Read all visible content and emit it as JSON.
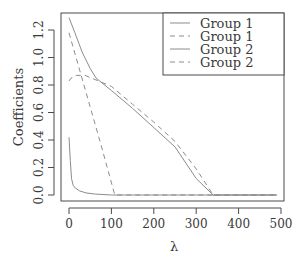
{
  "chart_data": {
    "type": "line",
    "title": "",
    "xlabel": "λ",
    "ylabel": "Coefficients",
    "xlim": [
      -12,
      512
    ],
    "ylim": [
      -0.04,
      1.32
    ],
    "grid": false,
    "legend_position": "top-right",
    "x_ticks": [
      0,
      100,
      200,
      300,
      400,
      500
    ],
    "x_tick_labels": [
      "0",
      "100",
      "200",
      "300",
      "400",
      "500"
    ],
    "y_ticks": [
      0.0,
      0.2,
      0.4,
      0.6,
      0.8,
      1.0,
      1.2
    ],
    "y_tick_labels": [
      "0.0",
      "0.2",
      "0.4",
      "0.6",
      "0.8",
      "1.0",
      "1.2"
    ],
    "series": [
      {
        "name": "Group 1",
        "style": "solid",
        "color": "#8c8c8c",
        "x": [
          0,
          14,
          31,
          50,
          64,
          100,
          150,
          200,
          250,
          300,
          340,
          490
        ],
        "y": [
          1.29,
          1.18,
          1.04,
          0.92,
          0.85,
          0.76,
          0.63,
          0.49,
          0.35,
          0.12,
          0.0,
          0.0
        ]
      },
      {
        "name": "Group 1",
        "style": "dashed",
        "color": "#8c8c8c",
        "x": [
          0,
          25,
          50,
          75,
          108,
          490
        ],
        "y": [
          1.18,
          0.91,
          0.64,
          0.37,
          0.0,
          0.0
        ]
      },
      {
        "name": "Group 2",
        "style": "solid",
        "color": "#8c8c8c",
        "x": [
          0,
          3,
          6,
          10,
          15,
          25,
          40,
          60,
          100,
          490
        ],
        "y": [
          0.42,
          0.25,
          0.12,
          0.07,
          0.05,
          0.03,
          0.015,
          0.007,
          0.0,
          0.0
        ]
      },
      {
        "name": "Group 2",
        "style": "dashed",
        "color": "#8c8c8c",
        "x": [
          0,
          8,
          16,
          38,
          100,
          150,
          200,
          250,
          300,
          340,
          490
        ],
        "y": [
          0.83,
          0.86,
          0.87,
          0.87,
          0.79,
          0.66,
          0.53,
          0.39,
          0.19,
          0.0,
          0.0
        ]
      }
    ]
  },
  "legend": {
    "items": [
      {
        "label": "Group 1",
        "style": "solid"
      },
      {
        "label": "Group 1",
        "style": "dashed"
      },
      {
        "label": "Group 2",
        "style": "solid"
      },
      {
        "label": "Group 2",
        "style": "dashed"
      }
    ]
  },
  "colors": {
    "axis": "#4a4a4a",
    "series": "#8c8c8c",
    "text": "#3a3a3a"
  }
}
